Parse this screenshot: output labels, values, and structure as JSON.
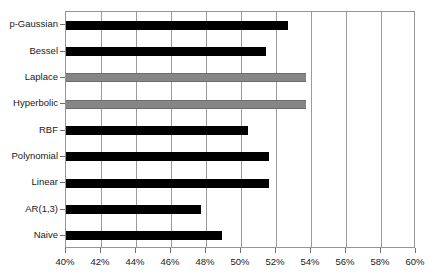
{
  "chart_data": {
    "type": "bar",
    "orientation": "horizontal",
    "title": "",
    "subtitle": "",
    "xlabel": "",
    "ylabel": "",
    "xlim": [
      40,
      60
    ],
    "xtick_step": 2,
    "grid": true,
    "legend": "none",
    "categories": [
      "p-Gaussian",
      "Bessel",
      "Laplace",
      "Hyperbolic",
      "RBF",
      "Polynomial",
      "Linear",
      "AR(1,3)",
      "Naive"
    ],
    "values": [
      52.7,
      51.4,
      53.7,
      53.7,
      50.4,
      51.6,
      51.6,
      47.7,
      48.9
    ],
    "bar_colors": [
      "#000000",
      "#000000",
      "#868686",
      "#868686",
      "#000000",
      "#000000",
      "#000000",
      "#000000",
      "#000000"
    ],
    "xtick_labels": [
      "40%",
      "42%",
      "44%",
      "46%",
      "48%",
      "50%",
      "52%",
      "54%",
      "56%",
      "58%",
      "60%"
    ],
    "xtick_values": [
      40,
      42,
      44,
      46,
      48,
      50,
      52,
      54,
      56,
      58,
      60
    ]
  },
  "style": {
    "plot_background": "#ffffff",
    "frame_color": "#959595",
    "gridline_color": "#9a9a9a",
    "bar_black": "#000000",
    "bar_gray": "#868686",
    "text_color": "#1a1a1a"
  }
}
